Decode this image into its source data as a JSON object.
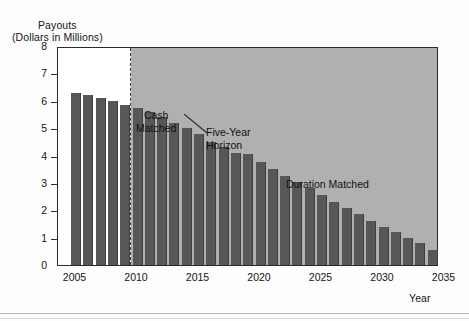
{
  "chart_data": {
    "type": "bar",
    "title": "",
    "ylabel_line1": "Payouts",
    "ylabel_line2": "(Dollars in Millions)",
    "xlabel": "Year",
    "ylim": [
      0,
      8
    ],
    "ytick_labels": [
      "8",
      "7",
      "6",
      "5",
      "4",
      "3",
      "2",
      "1",
      "0"
    ],
    "ytick_values": [
      8,
      7,
      6,
      5,
      4,
      3,
      2,
      1,
      0
    ],
    "xtick_labels": [
      "2005",
      "2010",
      "2015",
      "2020",
      "2025",
      "2030",
      "2035"
    ],
    "xtick_values": [
      2005,
      2010,
      2015,
      2020,
      2025,
      2030,
      2035
    ],
    "xlim": [
      2005,
      2035
    ],
    "grid": false,
    "legend": "none",
    "categories": [
      "2005",
      "2006",
      "2007",
      "2008",
      "2009",
      "2010",
      "2011",
      "2012",
      "2013",
      "2014",
      "2015",
      "2016",
      "2017",
      "2018",
      "2019",
      "2020",
      "2021",
      "2022",
      "2023",
      "2024",
      "2025",
      "2026",
      "2027",
      "2028",
      "2029",
      "2030",
      "2031",
      "2032",
      "2033",
      "2034"
    ],
    "values": [
      6.3,
      6.2,
      6.1,
      6.0,
      5.85,
      5.75,
      5.6,
      5.4,
      5.2,
      5.0,
      4.8,
      4.5,
      4.3,
      4.1,
      4.05,
      3.75,
      3.5,
      3.25,
      3.05,
      2.8,
      2.55,
      2.3,
      2.1,
      1.85,
      1.6,
      1.4,
      1.2,
      1.0,
      0.8,
      0.55
    ],
    "bar_color": "#575757",
    "annotations": [
      {
        "id": "cash-matched",
        "text": "Cash\nMatched",
        "region": "white",
        "x_range": [
          2005,
          2009
        ]
      },
      {
        "id": "five-year-horizon",
        "text": "Five-Year\nHorizon",
        "marker": "dashed-vertical-line",
        "at_x": 2009.6
      },
      {
        "id": "duration-matched",
        "text": "Duration Matched",
        "region": "shaded",
        "x_range": [
          2010,
          2035
        ]
      }
    ],
    "shaded_region_color": "#b0b0b0",
    "unshaded_region_color": "#ffffff",
    "frame_color": "#2a2a2a"
  }
}
